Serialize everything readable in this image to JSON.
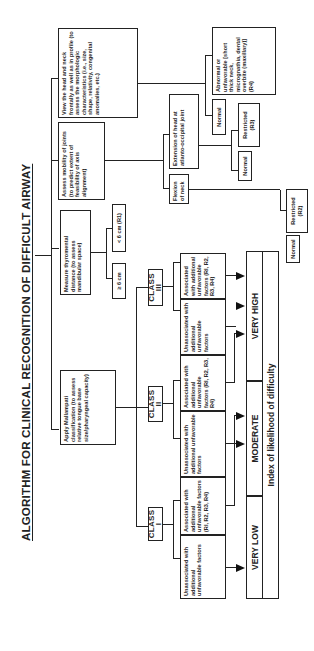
{
  "title": "ALGORITHM FOR CLINICAL RECOGNITION OF DIFFICULT AIRWAY",
  "assessments": [
    {
      "id": "view",
      "text": "View the head and neck frontally as well as in profile (to assess the morphologic characteristics (i.e., size, shape, relativity, congenital anomalies, etc.)"
    },
    {
      "id": "mobility",
      "text": "Assess mobility of joints (to predict extent of feasibility of axis alignment)"
    },
    {
      "id": "thyromental",
      "text": "Measure thyromental distance (to assess mandibular space)"
    },
    {
      "id": "mallampati",
      "text": "Apply Mallampati classification (to assess relative tongue base size/pharyngeal capacity)"
    }
  ],
  "view_outcomes": {
    "normal": "Normal",
    "abnormal": "Abnormal or unfavorable [short thick neck, micrognathia, dental overbite (maxillary)] (R4)"
  },
  "mobility_branches": {
    "extension": "Extension of head at atlanto-occipital joint",
    "extension_normal": "Normal",
    "extension_restricted": "Restricted (R3)",
    "flexion": "Flexion of neck",
    "flexion_normal": "Normal",
    "flexion_restricted": "Restricted (R2)"
  },
  "thyromental_outcomes": {
    "less": "< 6 cm (R1)",
    "greater": "≥ 6 cm"
  },
  "classes": [
    {
      "label": "CLASS I",
      "unassoc": "Unassociated with additional unfavorable factors",
      "assoc": "Associated with additional unfavorable factors (RI, R2, R3, R4)"
    },
    {
      "label": "CLASS II",
      "unassoc": "Unassociated with additional unfavorable factors",
      "assoc": "Associated with additional unfavorable factors (RI, R2, R3, R4)"
    },
    {
      "label": "CLASS III",
      "unassoc": "Unassociated with additional unfavorable factors",
      "assoc": "Associated with additional unfavorable factors (RI, R2, R3, R4)"
    }
  ],
  "difficulty": {
    "very_low": "VERY LOW",
    "moderate": "MODERATE",
    "very_high": "VERY HIGH",
    "index_label": "Index of likelihood of difficulty"
  }
}
